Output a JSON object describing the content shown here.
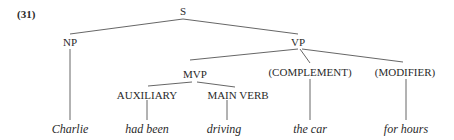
{
  "example_number": "(31)",
  "nodes": {
    "s": "S",
    "np": "NP",
    "vp": "VP",
    "mvp": "MVP",
    "complement": "(COMPLEMENT)",
    "modifier": "(MODIFIER)",
    "auxiliary": "AUXILIARY",
    "main_verb": "MAIN VERB"
  },
  "leaves": {
    "np": "Charlie",
    "auxiliary": "had been",
    "main_verb": "driving",
    "complement": "the car",
    "modifier": "for hours"
  },
  "tree": {
    "label": "S",
    "children": [
      {
        "label": "NP",
        "children": [
          {
            "label": "Charlie"
          }
        ]
      },
      {
        "label": "VP",
        "children": [
          {
            "label": "MVP",
            "children": [
              {
                "label": "AUXILIARY",
                "children": [
                  {
                    "label": "had been"
                  }
                ]
              },
              {
                "label": "MAIN VERB",
                "children": [
                  {
                    "label": "driving"
                  }
                ]
              }
            ]
          },
          {
            "label": "(COMPLEMENT)",
            "children": [
              {
                "label": "the car"
              }
            ]
          },
          {
            "label": "(MODIFIER)",
            "children": [
              {
                "label": "for hours"
              }
            ]
          }
        ]
      }
    ]
  }
}
